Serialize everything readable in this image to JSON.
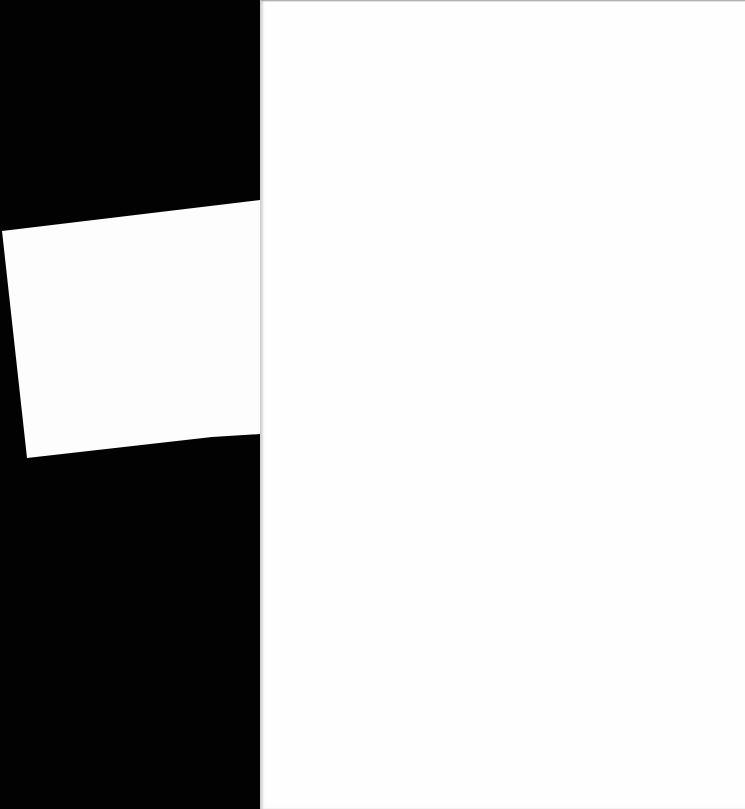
{
  "scene": {
    "description": "Two blank white sheets of paper on a black background",
    "colors": {
      "background": "#000000",
      "paper": "#fefefe"
    },
    "sheets": [
      {
        "name": "large-sheet",
        "text": ""
      },
      {
        "name": "small-tilted-sheet",
        "text": ""
      }
    ]
  }
}
